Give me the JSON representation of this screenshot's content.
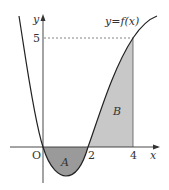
{
  "diagram": {
    "function_label": "y=f(x)",
    "axis_labels": {
      "x": "x",
      "y": "y",
      "origin": "O"
    },
    "x_ticks": [
      "2",
      "4"
    ],
    "y_ticks": [
      "5"
    ],
    "regions": [
      {
        "label": "A",
        "description": "area between curve and x-axis from 0 to 2 (below axis)",
        "fill": "#9a9a9a"
      },
      {
        "label": "B",
        "description": "area between curve and x-axis from 2 to 4 (above axis)",
        "fill": "#c8c8c8"
      }
    ],
    "colors": {
      "curve": "#222222",
      "axis": "#333333",
      "dashed": "#666666"
    }
  }
}
